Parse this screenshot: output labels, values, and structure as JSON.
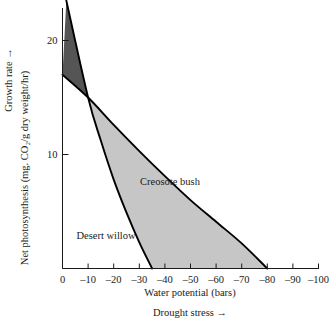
{
  "chart_data": {
    "type": "area",
    "title": "",
    "xlabel": "Water potential (bars)",
    "xlabel_secondary": "Drought stress →",
    "ylabel": "Net photosynthesis (mg. CO₂/g dry weight/hr)",
    "ylabel_secondary": "Growth rate →",
    "xlim": [
      0,
      -100
    ],
    "ylim": [
      0,
      24
    ],
    "grid": false,
    "legend_position": "inline-annotations",
    "xticks": [
      0,
      -10,
      -20,
      -30,
      -40,
      -50,
      -60,
      -70,
      -80,
      -90,
      -100
    ],
    "xtick_labels": [
      "0",
      "–10",
      "–20",
      "–30",
      "–40",
      "–50",
      "–60",
      "–70",
      "–80",
      "–90",
      "–100"
    ],
    "yticks": [
      10,
      20
    ],
    "ytick_labels": [
      "10",
      "20"
    ],
    "fill_between_label": "area between curves",
    "series": [
      {
        "name": "Desert willow",
        "color": "#000000",
        "fill_upper_color": "#555555",
        "points": [
          {
            "x": -1.5,
            "y": 23.5
          },
          {
            "x": -10,
            "y": 15.0
          },
          {
            "x": -15,
            "y": 11.2
          },
          {
            "x": -20,
            "y": 7.8
          },
          {
            "x": -25,
            "y": 4.9
          },
          {
            "x": -30,
            "y": 2.3
          },
          {
            "x": -35,
            "y": 0
          }
        ]
      },
      {
        "name": "Creosote bush",
        "color": "#000000",
        "fill_lower_color": "#c6c6c6",
        "points": [
          {
            "x": 0,
            "y": 17.0
          },
          {
            "x": -10,
            "y": 15.0
          },
          {
            "x": -20,
            "y": 12.6
          },
          {
            "x": -30,
            "y": 10.3
          },
          {
            "x": -40,
            "y": 8.1
          },
          {
            "x": -50,
            "y": 6.0
          },
          {
            "x": -60,
            "y": 4.1
          },
          {
            "x": -70,
            "y": 2.2
          },
          {
            "x": -80,
            "y": 0
          }
        ]
      }
    ],
    "annotations": [
      {
        "text": "Creosote bush",
        "x": -42,
        "y": 7.3
      },
      {
        "text": "Desert willow",
        "x": -17,
        "y": 2.6
      }
    ],
    "colors": {
      "dark_wedge": "#555555",
      "light_fill": "#c6c6c6",
      "axis": "#1a1a1a",
      "curve": "#000000",
      "background": "#ffffff"
    }
  }
}
